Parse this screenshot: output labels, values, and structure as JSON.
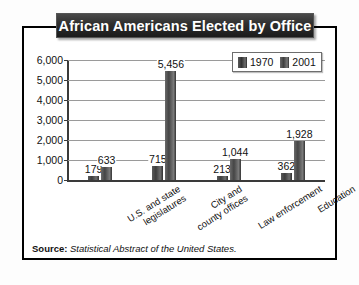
{
  "figure": {
    "title": "African Americans Elected by Office",
    "source_label": "Source:",
    "source_text": "Statistical Abstract of the United States."
  },
  "chart_data": {
    "type": "bar",
    "title": "African Americans Elected by Office",
    "xlabel": "",
    "ylabel": "Elected Officials",
    "ylim": [
      0,
      6000
    ],
    "ytick_labels": [
      "0",
      "1,000",
      "2,000",
      "3,000",
      "4,000",
      "5,000",
      "6,000"
    ],
    "ytick_values": [
      0,
      1000,
      2000,
      3000,
      4000,
      5000,
      6000
    ],
    "grid": true,
    "legend_position": "top-right",
    "categories": [
      "U.S. and state legislatures",
      "City and county offices",
      "Law enforcement",
      "Education"
    ],
    "category_lines": [
      [
        "U.S. and state",
        "legislatures"
      ],
      [
        "City and",
        "county offices"
      ],
      [
        "Law enforcement",
        ""
      ],
      [
        "Education",
        ""
      ]
    ],
    "series": [
      {
        "name": "1970",
        "color": "#3d3d3d",
        "values": [
          179,
          715,
          213,
          362
        ],
        "value_labels": [
          "179",
          "715",
          "213",
          "362"
        ]
      },
      {
        "name": "2001",
        "color": "#454545",
        "values": [
          633,
          5456,
          1044,
          1928
        ],
        "value_labels": [
          "633",
          "5,456",
          "1,044",
          "1,928"
        ]
      }
    ]
  }
}
